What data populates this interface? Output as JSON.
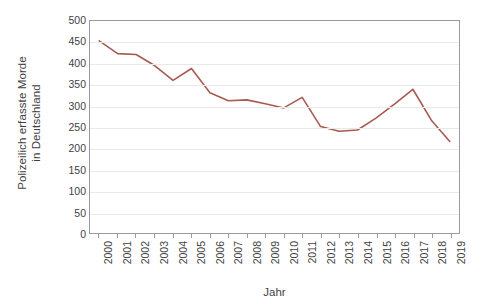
{
  "chart_data": {
    "type": "line",
    "title": "",
    "xlabel": "Jahr",
    "ylabel": "Polizeilich erfasste Morde in Deutschland",
    "ylabel_lines": [
      "Polizeilich erfasste Morde",
      "in Deutschland"
    ],
    "categories": [
      "2000",
      "2001",
      "2002",
      "2003",
      "2004",
      "2005",
      "2006",
      "2007",
      "2008",
      "2009",
      "2010",
      "2011",
      "2012",
      "2013",
      "2014",
      "2015",
      "2016",
      "2017",
      "2018",
      "2019"
    ],
    "values": [
      453,
      423,
      421,
      395,
      360,
      388,
      331,
      312,
      314,
      305,
      295,
      320,
      251,
      240,
      243,
      271,
      304,
      339,
      266,
      216
    ],
    "series": [
      {
        "name": "Polizeilich erfasste Morde in Deutschland",
        "values": [
          453,
          423,
          421,
          395,
          360,
          388,
          331,
          312,
          314,
          305,
          295,
          320,
          251,
          240,
          243,
          271,
          304,
          339,
          266,
          216
        ]
      }
    ],
    "ylim": [
      0,
      500
    ],
    "ytick_values": [
      0,
      50,
      100,
      150,
      200,
      250,
      300,
      350,
      400,
      450,
      500
    ],
    "ytick_labels": [
      "0",
      "50",
      "100",
      "150",
      "200",
      "250",
      "300",
      "350",
      "400",
      "450",
      "500"
    ],
    "grid": true,
    "grid_axis": "y",
    "legend": false,
    "legend_position": "none",
    "line_color": "#a85a50",
    "line_width": 1.6,
    "markers": false,
    "plot_border_color": "#9b9b9b",
    "grid_color": "#e9e9e9",
    "background_color": "#ffffff",
    "text_color": "#3f3f3f",
    "xtick_rotation": -90
  }
}
